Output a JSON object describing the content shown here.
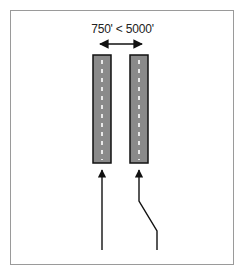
{
  "diagram": {
    "separation_label": "750' < 5000'",
    "runways": [
      {
        "name": "left-runway",
        "x": 93,
        "y": 55,
        "width": 18,
        "height": 108
      },
      {
        "name": "right-runway",
        "x": 130,
        "y": 55,
        "width": 18,
        "height": 108
      }
    ],
    "colors": {
      "runway_fill": "#8a8a8a",
      "runway_border": "#111111",
      "centerline": "#ffffff",
      "frame_border": "#9a9a9a",
      "arrow": "#111111"
    },
    "approach_paths": [
      {
        "name": "straight-approach",
        "points": "102,250 102,170"
      },
      {
        "name": "offset-approach",
        "points": "157,250 157,231 139,201 139,170"
      }
    ]
  }
}
